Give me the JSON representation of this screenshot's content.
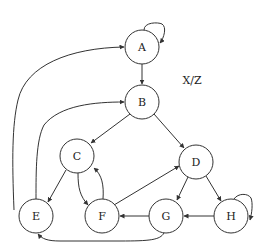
{
  "diagram": {
    "type": "state-graph",
    "annotation": "X/Z",
    "nodes": [
      {
        "id": "A",
        "label": "A",
        "x": 142,
        "y": 47
      },
      {
        "id": "B",
        "label": "B",
        "x": 142,
        "y": 102
      },
      {
        "id": "C",
        "label": "C",
        "x": 77,
        "y": 156
      },
      {
        "id": "D",
        "label": "D",
        "x": 196,
        "y": 162
      },
      {
        "id": "E",
        "label": "E",
        "x": 36,
        "y": 216
      },
      {
        "id": "F",
        "label": "F",
        "x": 102,
        "y": 216
      },
      {
        "id": "G",
        "label": "G",
        "x": 166,
        "y": 216
      },
      {
        "id": "H",
        "label": "H",
        "x": 231,
        "y": 216
      }
    ],
    "edges": [
      {
        "from": "A",
        "to": "A",
        "kind": "self-loop"
      },
      {
        "from": "A",
        "to": "B"
      },
      {
        "from": "E",
        "to": "A"
      },
      {
        "from": "E",
        "to": "B"
      },
      {
        "from": "B",
        "to": "C"
      },
      {
        "from": "B",
        "to": "D"
      },
      {
        "from": "C",
        "to": "E"
      },
      {
        "from": "C",
        "to": "F"
      },
      {
        "from": "F",
        "to": "C"
      },
      {
        "from": "F",
        "to": "D"
      },
      {
        "from": "D",
        "to": "G"
      },
      {
        "from": "D",
        "to": "H"
      },
      {
        "from": "H",
        "to": "H",
        "kind": "self-loop"
      },
      {
        "from": "H",
        "to": "G"
      },
      {
        "from": "G",
        "to": "F"
      },
      {
        "from": "G",
        "to": "E"
      }
    ]
  }
}
